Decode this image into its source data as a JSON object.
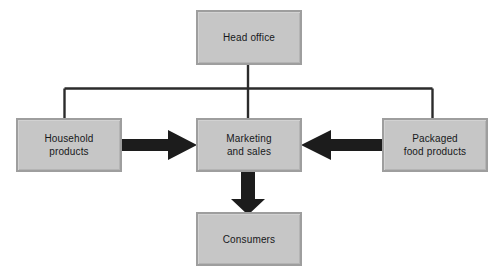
{
  "diagram": {
    "type": "organisation-flow-diagram",
    "canvas": {
      "width": 494,
      "height": 276,
      "background": "#ffffff"
    },
    "style": {
      "box_fill": "#c6c6c6",
      "box_border": "#9e9e9e",
      "connector_color": "#2b2b2b",
      "arrow_color": "#1c1c1c",
      "text_color": "#17181a"
    },
    "nodes": [
      {
        "id": "head-office",
        "label": "Head office",
        "x": 196,
        "y": 10,
        "w": 106,
        "h": 55
      },
      {
        "id": "household-products",
        "label": "Household\nproducts",
        "x": 16,
        "y": 118,
        "w": 106,
        "h": 54
      },
      {
        "id": "marketing-and-sales",
        "label": "Marketing\nand sales",
        "x": 196,
        "y": 118,
        "w": 106,
        "h": 54
      },
      {
        "id": "packaged-food-products",
        "label": "Packaged\nfood products",
        "x": 382,
        "y": 118,
        "w": 106,
        "h": 54
      },
      {
        "id": "consumers",
        "label": "Consumers",
        "x": 196,
        "y": 212,
        "w": 106,
        "h": 54
      }
    ],
    "connectors": [
      {
        "id": "head-office-to-bus",
        "kind": "thin-line",
        "from": "head-office",
        "to": "bus"
      },
      {
        "id": "bus-to-household-products",
        "kind": "thin-line",
        "from": "bus",
        "to": "household-products"
      },
      {
        "id": "bus-to-marketing-and-sales",
        "kind": "thin-line",
        "from": "bus",
        "to": "marketing-and-sales"
      },
      {
        "id": "bus-to-packaged-food-products",
        "kind": "thin-line",
        "from": "bus",
        "to": "packaged-food-products"
      }
    ],
    "arrows": [
      {
        "id": "household-to-marketing-arrow",
        "direction": "right",
        "from": "household-products",
        "to": "marketing-and-sales"
      },
      {
        "id": "packaged-to-marketing-arrow",
        "direction": "left",
        "from": "packaged-food-products",
        "to": "marketing-and-sales"
      },
      {
        "id": "marketing-to-consumers-arrow",
        "direction": "down",
        "from": "marketing-and-sales",
        "to": "consumers"
      }
    ]
  }
}
